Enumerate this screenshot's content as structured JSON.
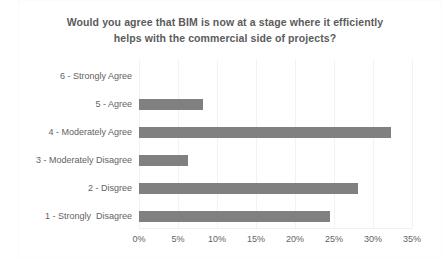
{
  "chart_data": {
    "type": "bar",
    "orientation": "horizontal",
    "title": "Would you agree that BIM is now at a stage where it efficiently helps with the commercial side of projects?",
    "title_line_1": "Would you agree that BIM is now at a stage where it efficiently",
    "title_line_2": "helps with the commercial side of projects?",
    "xlabel": "",
    "ylabel": "",
    "categories": [
      "6 - Strongly Agree",
      "5 - Agree",
      "4 - Moderately Agree",
      "3 - Moderately Disagree",
      "2 - Disgree",
      "1 - Strongly  Disagree"
    ],
    "values": [
      0,
      8.2,
      32.3,
      6.3,
      28.1,
      24.5
    ],
    "value_labels": [
      "0%",
      "8.2%",
      "32.3%",
      "6.3%",
      "28.1%",
      "24.5%"
    ],
    "xlim": [
      0,
      35
    ],
    "xticks": [
      0,
      5,
      10,
      15,
      20,
      25,
      30,
      35
    ],
    "xtick_labels": [
      "0%",
      "5%",
      "10%",
      "15%",
      "20%",
      "25%",
      "30%",
      "35%"
    ],
    "grid": true,
    "grid_axis": "x",
    "legend": false,
    "bar_color": "#808080",
    "gridline_color": "#f2f2f2",
    "text_color": "#636363",
    "title_color": "#5b5b5b",
    "background_color": "#ffffff"
  }
}
